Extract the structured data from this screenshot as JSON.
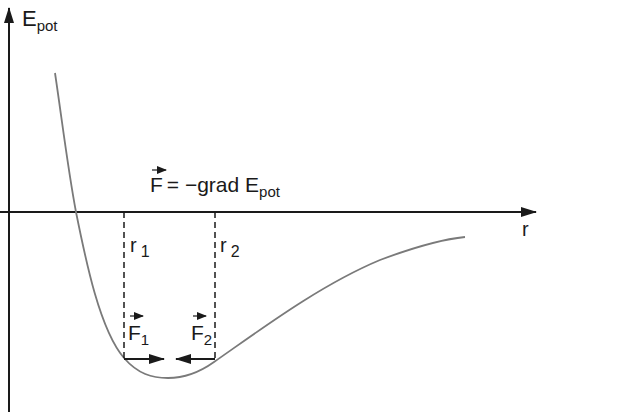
{
  "diagram": {
    "y_axis": {
      "label": "E",
      "label_sub": "pot"
    },
    "x_axis": {
      "label": "r"
    },
    "formula": {
      "lhs": "F",
      "eq": "= −grad E",
      "sub": "pot"
    },
    "markers": [
      {
        "label": "r",
        "sub": "1"
      },
      {
        "label": "r",
        "sub": "2"
      }
    ],
    "forces": [
      {
        "label": "F",
        "sub": "1",
        "direction": "right"
      },
      {
        "label": "F",
        "sub": "2",
        "direction": "left"
      }
    ],
    "colors": {
      "axis": "#1a1a1a",
      "curve": "#7a7a7a",
      "text": "#1a1a1a"
    }
  }
}
